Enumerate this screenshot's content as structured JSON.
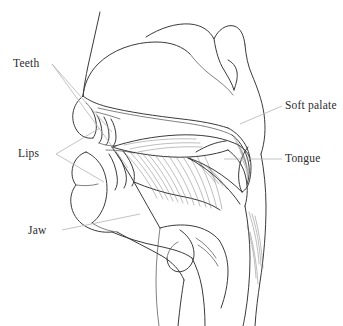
{
  "figure": {
    "type": "anatomical-line-diagram",
    "background_color": "#ffffff",
    "stroke_color": "#3a3a3a",
    "leader_color": "#b4b4b4",
    "text_color": "#2b2b2b",
    "width": 343,
    "height": 326
  },
  "labels": {
    "teeth": "Teeth",
    "lips": "Lips",
    "jaw": "Jaw",
    "soft_palate": "Soft palate",
    "tongue": "Tongue"
  },
  "annotations": [
    {
      "id": "teeth",
      "text": "Teeth",
      "side": "left",
      "leader_count": 2
    },
    {
      "id": "lips",
      "text": "Lips",
      "side": "left",
      "leader_count": 2
    },
    {
      "id": "jaw",
      "text": "Jaw",
      "side": "left",
      "leader_count": 1
    },
    {
      "id": "soft-palate",
      "text": "Soft palate",
      "side": "right",
      "leader_count": 1
    },
    {
      "id": "tongue",
      "text": "Tongue",
      "side": "right",
      "leader_count": 1
    }
  ]
}
